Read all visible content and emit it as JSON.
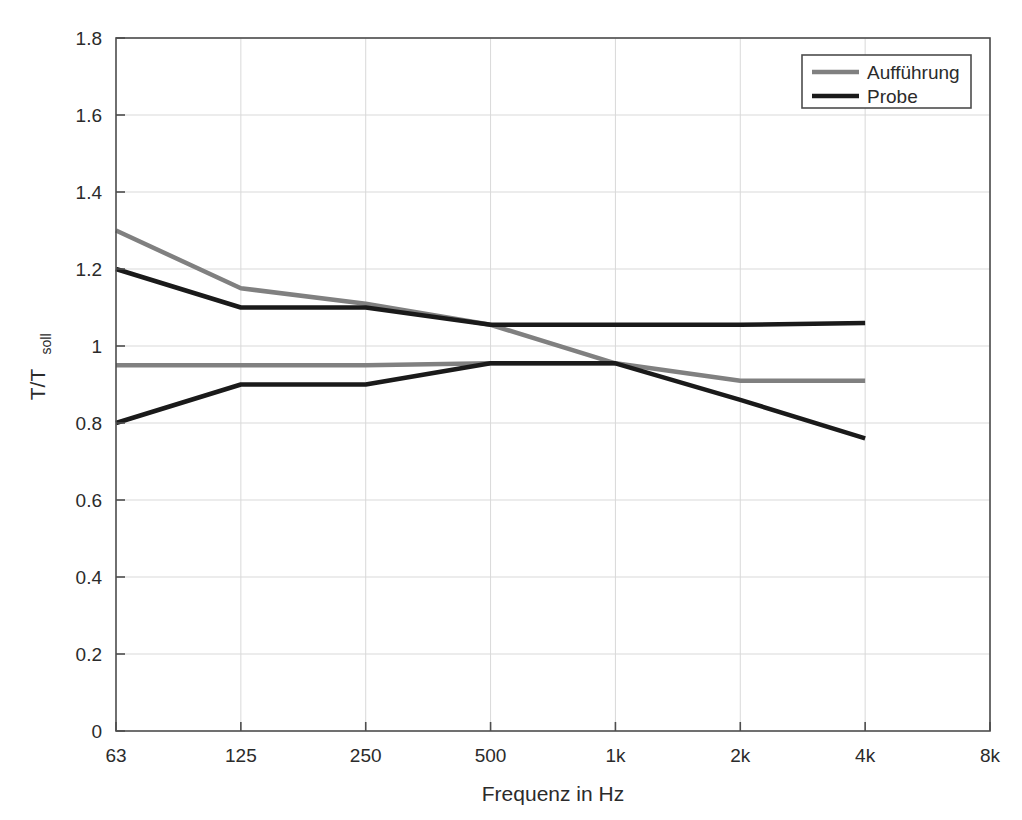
{
  "chart_data": {
    "type": "line",
    "title": "",
    "subtitle": "",
    "xlabel": "Frequenz in Hz",
    "ylabel": "T/T",
    "ylabel_sub": "soll",
    "x_tick_labels": [
      "63",
      "125",
      "250",
      "500",
      "1k",
      "2k",
      "4k",
      "8k"
    ],
    "x_categories": [
      63,
      125,
      250,
      500,
      1000,
      2000,
      4000,
      8000
    ],
    "y_tick_labels": [
      "0",
      "0.2",
      "0.4",
      "0.6",
      "0.8",
      "1",
      "1.2",
      "1.4",
      "1.6",
      "1.8"
    ],
    "y_tick_values": [
      0,
      0.2,
      0.4,
      0.6,
      0.8,
      1,
      1.2,
      1.4,
      1.6,
      1.8
    ],
    "ylim": [
      0,
      1.8
    ],
    "xlim_index": [
      0,
      7
    ],
    "grid": true,
    "legend_position": "top-right",
    "legend": [
      "Aufführung",
      "Probe"
    ],
    "colors": {
      "auffuehrung": "#808080",
      "probe": "#1a1a1a",
      "grid": "#d9d9d9",
      "axis": "#4d4d4d",
      "background": "#ffffff"
    },
    "series": [
      {
        "name": "Aufführung",
        "bound": "upper",
        "color": "#808080",
        "x_labels": [
          "63",
          "125",
          "250",
          "500",
          "1k",
          "2k",
          "4k"
        ],
        "values": [
          1.3,
          1.15,
          1.11,
          1.055,
          0.955,
          null,
          null
        ]
      },
      {
        "name": "Aufführung",
        "bound": "lower",
        "color": "#808080",
        "x_labels": [
          "63",
          "125",
          "250",
          "500",
          "1k",
          "2k",
          "4k"
        ],
        "values": [
          0.95,
          0.95,
          0.95,
          0.955,
          0.955,
          0.91,
          0.91
        ]
      },
      {
        "name": "Probe",
        "bound": "upper",
        "color": "#1a1a1a",
        "x_labels": [
          "63",
          "125",
          "250",
          "500",
          "1k",
          "2k",
          "4k"
        ],
        "values": [
          1.2,
          1.1,
          1.1,
          1.055,
          1.055,
          1.055,
          1.06
        ]
      },
      {
        "name": "Probe",
        "bound": "lower",
        "color": "#1a1a1a",
        "x_labels": [
          "63",
          "125",
          "250",
          "500",
          "1k",
          "2k",
          "4k"
        ],
        "values": [
          0.8,
          0.9,
          0.9,
          0.955,
          0.955,
          0.86,
          0.76
        ]
      }
    ]
  }
}
